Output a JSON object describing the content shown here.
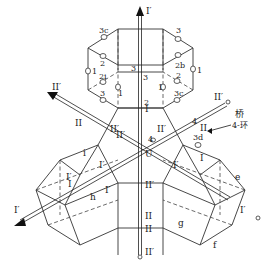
{
  "axes": {
    "I_prime_label": "I′",
    "II_prime_label": "II′",
    "I_label": "I",
    "II_label": "II",
    "center_label": "U"
  },
  "sites": {
    "s1": "1",
    "s2": "2",
    "s3": "3",
    "s2b": "2b",
    "s2i": "2i",
    "s3c": "3c",
    "s3d": "3d",
    "s4": "4"
  },
  "faces": {
    "e": "e",
    "f": "f",
    "g": "g",
    "h": "h",
    "i": "i"
  },
  "annotation": {
    "bridge": "桥",
    "ring": "4-环"
  }
}
